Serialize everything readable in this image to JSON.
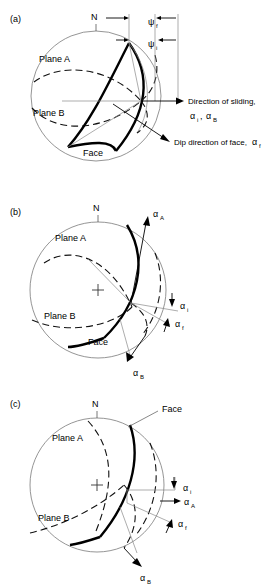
{
  "figure": {
    "type": "stereonet-wedge-failure-diagram",
    "panel_count": 3
  },
  "symbols": {
    "psi": "ψ",
    "alpha": "α",
    "north": "N",
    "center_mark": "+"
  },
  "panels": [
    {
      "id": "a",
      "label": "(a)",
      "north_label": "N",
      "labels": {
        "plane_a": "Plane A",
        "plane_b": "Plane B",
        "face": "Face"
      },
      "annotations": [
        {
          "name": "psi-f",
          "greek": "ψ",
          "sub": "f"
        },
        {
          "name": "psi-i",
          "greek": "ψ",
          "sub": "i"
        }
      ],
      "callouts": [
        {
          "name": "direction-of-sliding",
          "line1": "Direction of sliding,",
          "line2_greek_1": "α",
          "line2_sub_1": "i",
          "line2_sep": ", ",
          "line2_greek_2": "α",
          "line2_sub_2": "B"
        },
        {
          "name": "dip-direction-of-face",
          "line1": "Dip direction of face, ",
          "greek": "α",
          "sub": "f"
        }
      ]
    },
    {
      "id": "b",
      "label": "(b)",
      "north_label": "N",
      "labels": {
        "plane_a": "Plane A",
        "plane_b": "Plane B",
        "face": "Face"
      },
      "annotations": [
        {
          "name": "alpha-A",
          "greek": "α",
          "sub": "A"
        },
        {
          "name": "alpha-i",
          "greek": "α",
          "sub": "i"
        },
        {
          "name": "alpha-f",
          "greek": "α",
          "sub": "f"
        },
        {
          "name": "alpha-B",
          "greek": "α",
          "sub": "B"
        }
      ]
    },
    {
      "id": "c",
      "label": "(c)",
      "north_label": "N",
      "labels": {
        "plane_a": "Plane A",
        "plane_b": "Plane B",
        "face": "Face"
      },
      "annotations": [
        {
          "name": "alpha-i",
          "greek": "α",
          "sub": "i"
        },
        {
          "name": "alpha-A",
          "greek": "α",
          "sub": "A"
        },
        {
          "name": "alpha-f",
          "greek": "α",
          "sub": "f"
        },
        {
          "name": "alpha-B",
          "greek": "α",
          "sub": "B"
        }
      ]
    }
  ]
}
